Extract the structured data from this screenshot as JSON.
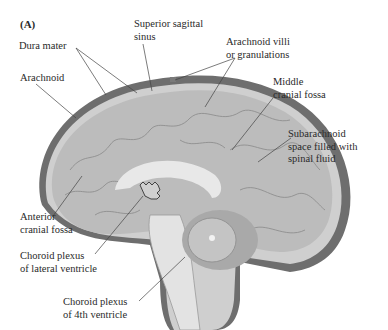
{
  "panel_label": "(A)",
  "labels": {
    "dura_mater": "Dura mater",
    "superior_sagittal_sinus": [
      "Superior sagittal",
      "sinus"
    ],
    "arachnoid_villi": [
      "Arachnoid villi",
      "or granulations"
    ],
    "arachnoid": "Arachnoid",
    "middle_cranial_fossa": [
      "Middle",
      "cranial fossa"
    ],
    "subarachnoid_space": [
      "Subarachnoid",
      "space filled with",
      "spinal fluid"
    ],
    "anterior_cranial_fossa": [
      "Anterior",
      "cranial fossa"
    ],
    "choroid_plexus_lateral": [
      "Choroid plexus",
      "of lateral ventricle"
    ],
    "choroid_plexus_4th": [
      "Choroid plexus",
      "of 4th ventricle"
    ]
  },
  "colors": {
    "dura": "#6e6e6e",
    "subarachnoid": "#c8c8c8",
    "cortex": "#bdbdbd",
    "gyri_lines": "#8a8a8a",
    "white_matter": "#e6e6e6",
    "leader_lines": "#444444"
  }
}
